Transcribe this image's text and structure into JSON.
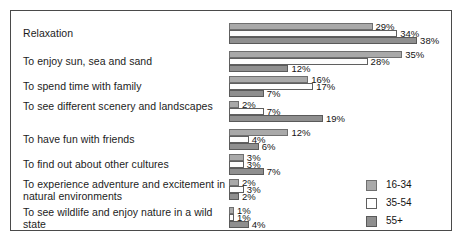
{
  "chart_data": {
    "type": "bar",
    "orientation": "horizontal",
    "title": "",
    "subtitle": "",
    "xlabel": "",
    "ylabel": "",
    "xlim": [
      0,
      40
    ],
    "grid": false,
    "legend_position": "bottom-right",
    "value_suffix": "%",
    "categories": [
      "Relaxation",
      "To enjoy sun, sea and sand",
      "To spend time with family",
      "To see different scenery and landscapes",
      "To have fun with friends",
      "To find out about other cultures",
      "To experience adventure and excitement in natural environments",
      "To see wildlife and enjoy nature in a wild state"
    ],
    "series": [
      {
        "name": "16-34",
        "color": "#a9a9a9",
        "values": [
          29,
          35,
          16,
          2,
          12,
          3,
          2,
          1
        ],
        "labels": [
          "29%",
          "35%",
          "16%",
          "2%",
          "12%",
          "3%",
          "2%",
          "1%"
        ]
      },
      {
        "name": "35-54",
        "color": "#ffffff",
        "values": [
          34,
          28,
          17,
          7,
          4,
          3,
          3,
          1
        ],
        "labels": [
          "34%",
          "28%",
          "17%",
          "7%",
          "4%",
          "3%",
          "3%",
          "1%"
        ]
      },
      {
        "name": "55+",
        "color": "#8f8f8f",
        "values": [
          38,
          12,
          7,
          19,
          6,
          7,
          2,
          4
        ],
        "labels": [
          "38%",
          "12%",
          "7%",
          "19%",
          "6%",
          "7%",
          "2%",
          "4%"
        ]
      }
    ]
  },
  "legend": {
    "items": [
      {
        "label": "16-34"
      },
      {
        "label": "35-54"
      },
      {
        "label": "55+"
      }
    ]
  }
}
